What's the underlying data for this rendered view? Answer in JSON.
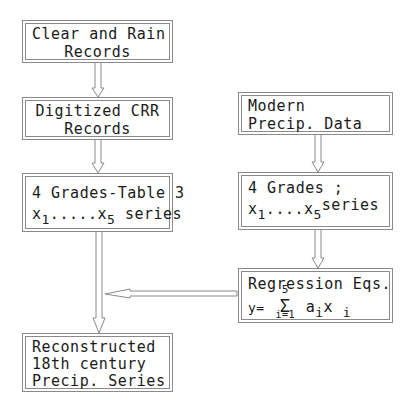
{
  "diagram": {
    "type": "flowchart",
    "nodes": [
      {
        "id": "clear_rain",
        "lines": [
          "Clear and Rain",
          "Records"
        ]
      },
      {
        "id": "digitized",
        "lines": [
          "Digitized CRR",
          "Records"
        ]
      },
      {
        "id": "grades_table",
        "line1": "4 Grades-Table 3",
        "x_var": "x",
        "sub_start": "1",
        "dots": ".....",
        "sub_end": "5",
        "suffix": " series"
      },
      {
        "id": "modern",
        "lines": [
          "Modern",
          "Precip. Data"
        ]
      },
      {
        "id": "grades_modern",
        "line1": "4 Grades ;",
        "x_var": "x",
        "sub_start": "1",
        "dots": "....",
        "sub_end": "5",
        "suffix": "series"
      },
      {
        "id": "regression",
        "line1": "Regression Eqs.",
        "eq_lhs": "y=",
        "sigma": "Σ",
        "sigma_upper": "5",
        "sigma_lower": "i=1",
        "term_a": "a",
        "term_a_sub": "i",
        "term_x": "x",
        "term_x_sub": "i"
      },
      {
        "id": "reconstructed",
        "lines": [
          "Reconstructed",
          "18th century",
          "Precip. Series"
        ]
      }
    ],
    "edges": [
      {
        "from": "clear_rain",
        "to": "digitized"
      },
      {
        "from": "digitized",
        "to": "grades_table"
      },
      {
        "from": "grades_table",
        "to": "reconstructed"
      },
      {
        "from": "modern",
        "to": "grades_modern"
      },
      {
        "from": "grades_modern",
        "to": "regression"
      },
      {
        "from": "regression",
        "to": "reconstructed"
      }
    ],
    "colors": {
      "stroke": "#8a8a8a",
      "text": "#1a1a1a",
      "background": "#ffffff"
    }
  }
}
